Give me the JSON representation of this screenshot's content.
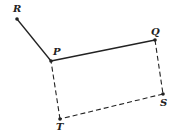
{
  "diagram": {
    "points": [
      {
        "id": "R",
        "label": "R",
        "x": 17,
        "y": 19,
        "lx": 13,
        "ly": 12
      },
      {
        "id": "P",
        "label": "P",
        "x": 51,
        "y": 61,
        "lx": 53,
        "ly": 55
      },
      {
        "id": "Q",
        "label": "Q",
        "x": 155,
        "y": 40,
        "lx": 151,
        "ly": 35
      },
      {
        "id": "S",
        "label": "S",
        "x": 163,
        "y": 94,
        "lx": 160,
        "ly": 106
      },
      {
        "id": "T",
        "label": "T",
        "x": 60,
        "y": 119,
        "lx": 56,
        "ly": 130
      }
    ],
    "segments": [
      {
        "from": "R",
        "to": "P",
        "style": "solid"
      },
      {
        "from": "P",
        "to": "Q",
        "style": "solid"
      },
      {
        "from": "Q",
        "to": "S",
        "style": "dashed"
      },
      {
        "from": "S",
        "to": "T",
        "style": "dashed"
      },
      {
        "from": "T",
        "to": "P",
        "style": "dashed"
      }
    ],
    "colors": {
      "line": "#222222",
      "background": "#ffffff"
    }
  }
}
